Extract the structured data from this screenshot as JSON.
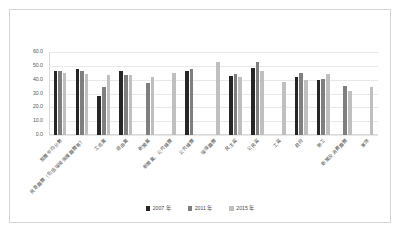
{
  "chart_data": {
    "type": "bar",
    "title": "",
    "xlabel": "",
    "ylabel": "",
    "ylim": [
      0.0,
      60.0
    ],
    "ystep": 10.0,
    "grid": true,
    "legend_position": "bottom",
    "ytick_labels": [
      "60.0",
      "50.0",
      "40.0",
      "30.0",
      "20.0",
      "10.0",
      "0.0"
    ],
    "categories": [
      "整體平均分數",
      "民意團體（包括環境保護團體等）",
      "工商業",
      "自由業",
      "新聞業",
      "新聞業、公共媒體",
      "公共媒體",
      "環保團體",
      "民主黨",
      "公民黨",
      "工黨",
      "政府",
      "勞工",
      "新聞及消費團體",
      "軍隊"
    ],
    "series": [
      {
        "name": "2007 年",
        "color": "#262626",
        "values": [
          46.5,
          47.5,
          28.0,
          46.5,
          null,
          null,
          46.5,
          null,
          42.5,
          48.5,
          null,
          42.0,
          40.0,
          null,
          null
        ]
      },
      {
        "name": "2011 年",
        "color": "#7f7f7f",
        "values": [
          46.5,
          46.0,
          34.5,
          43.5,
          37.5,
          null,
          47.5,
          null,
          44.0,
          53.0,
          null,
          44.5,
          40.5,
          35.5,
          null
        ]
      },
      {
        "name": "2015 年",
        "color": "#bfbfbf",
        "values": [
          45.0,
          44.0,
          43.5,
          43.5,
          42.0,
          45.0,
          null,
          53.0,
          42.0,
          46.5,
          38.5,
          40.0,
          44.0,
          32.0,
          34.5
        ]
      }
    ]
  },
  "legend": {
    "items": [
      {
        "label": "2007 年",
        "color": "#262626"
      },
      {
        "label": "2011 年",
        "color": "#7f7f7f"
      },
      {
        "label": "2015 年",
        "color": "#bfbfbf"
      }
    ]
  }
}
